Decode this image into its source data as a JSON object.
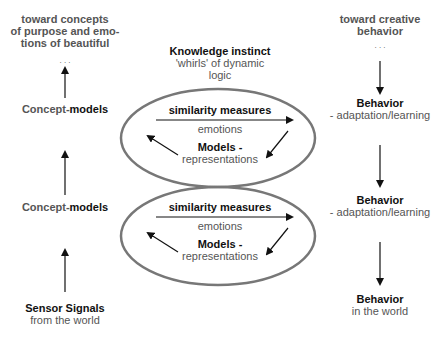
{
  "left_column": {
    "top_note": [
      "toward concepts",
      "of purpose  and emo-",
      "tions of beautiful"
    ],
    "ellipsis": ". . .",
    "level2": {
      "prefix": "Concept-",
      "bold": "models"
    },
    "level1": {
      "prefix": "Concept-",
      "bold": "models"
    },
    "bottom": {
      "title": "Sensor Signals",
      "subtitle": "from the world"
    }
  },
  "center": {
    "title": "Knowledge instinct",
    "subtitle_lines": [
      "'whirls' of dynamic",
      "logic"
    ],
    "loops": [
      {
        "measure": "similarity measures",
        "emotion": "emotions",
        "models": "Models -",
        "repr": "representations"
      },
      {
        "measure": "similarity measures",
        "emotion": "emotions",
        "models": "Models -",
        "repr": "representations"
      }
    ]
  },
  "right_column": {
    "top_note": [
      "toward creative",
      "behavior"
    ],
    "ellipsis": ". . .",
    "level2": {
      "title": "Behavior",
      "subtitle": "- adaptation/learning"
    },
    "level1": {
      "title": "Behavior",
      "subtitle": "- adaptation/learning"
    },
    "bottom": {
      "title": "Behavior",
      "subtitle": "in the world"
    }
  },
  "colors": {
    "ellipse": "#777777",
    "arrow": "#111111",
    "text_dark": "#111111",
    "text_gray": "#555555"
  }
}
